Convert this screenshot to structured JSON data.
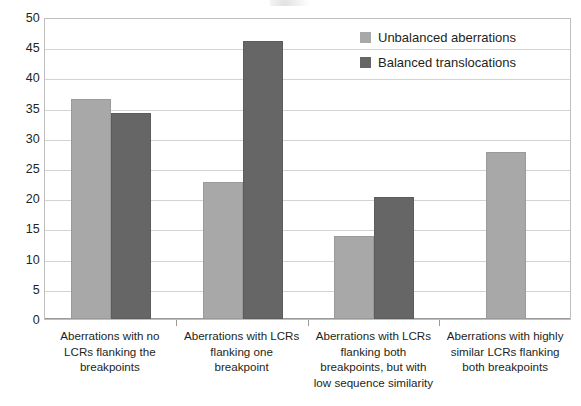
{
  "chart_data": {
    "type": "bar",
    "title": "",
    "subtitle": "",
    "xlabel": "",
    "ylabel": "",
    "ylim": [
      0,
      50
    ],
    "ytick_step": 5,
    "yticks": [
      "50",
      "45",
      "40",
      "35",
      "30",
      "25",
      "20",
      "15",
      "10",
      "5",
      "0"
    ],
    "grid": true,
    "legend_position": "top-right",
    "categories": [
      "Aberrations with no LCRs flanking the breakpoints",
      "Aberrations with LCRs flanking one breakpoint",
      "Aberrations with LCRs flanking both breakpoints, but with low sequence similarity",
      "Aberrations with highly similar LCRs flanking both breakpoints"
    ],
    "category_lines": [
      [
        "Aberrations with no",
        "LCRs flanking the",
        "breakpoints"
      ],
      [
        "Aberrations with LCRs",
        "flanking one",
        "breakpoint"
      ],
      [
        "Aberrations with LCRs",
        "flanking both",
        "breakpoints, but with",
        "low sequence similarity"
      ],
      [
        "Aberrations with highly",
        "similar LCRs flanking",
        "both breakpoints"
      ]
    ],
    "series": [
      {
        "name": "Unbalanced aberrations",
        "color": "#a8a8a8",
        "values": [
          36.4,
          22.7,
          13.8,
          27.6
        ]
      },
      {
        "name": "Balanced translocations",
        "color": "#666666",
        "values": [
          34.1,
          46.0,
          20.2,
          null
        ]
      }
    ]
  },
  "legend": {
    "items": [
      {
        "label": "Unbalanced aberrations",
        "color": "#a8a8a8"
      },
      {
        "label": "Balanced translocations",
        "color": "#666666"
      }
    ]
  },
  "colors": {
    "series_light": "#a8a8a8",
    "series_dark": "#666666",
    "gridline": "#d3d3d3",
    "axis": "#9a9a9a",
    "text": "#231f20",
    "background": "#ffffff"
  }
}
